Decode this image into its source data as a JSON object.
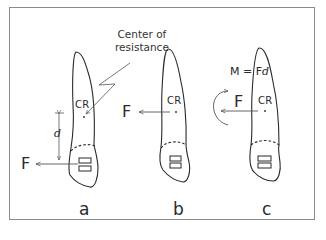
{
  "annotation": {
    "line1": "Center of",
    "line2": "resistance"
  },
  "panels": [
    {
      "label": "a",
      "cr_label": "CR",
      "force_label": "F",
      "distance_label": "d"
    },
    {
      "label": "b",
      "cr_label": "CR",
      "force_label": "F"
    },
    {
      "label": "c",
      "cr_label": "CR",
      "force_label": "F",
      "moment": {
        "lhs": "M = F",
        "d": "d"
      }
    }
  ],
  "colors": {
    "line": "#2a2a2a",
    "frame": "#8a8a8a"
  }
}
